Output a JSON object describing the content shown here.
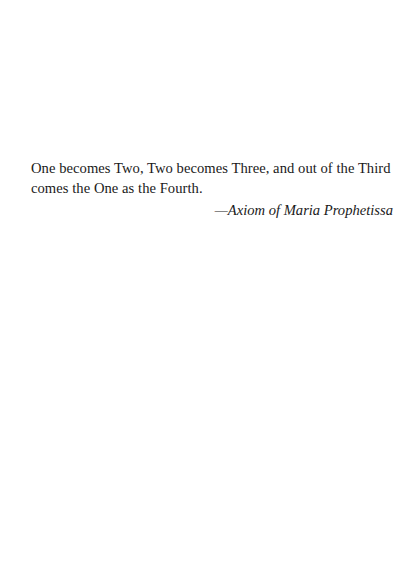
{
  "epigraph": {
    "quote": "One becomes Two, Two becomes Three, and out of the Third comes the One as the Fourth.",
    "attribution": "—Axiom of Maria Prophetissa"
  }
}
